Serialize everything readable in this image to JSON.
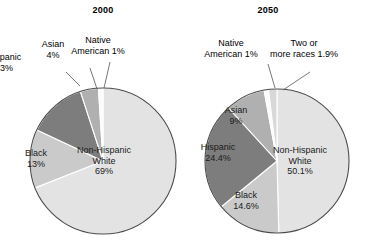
{
  "figure": {
    "background": "#ffffff",
    "charts": [
      {
        "id": "chart-2000",
        "title": "2000",
        "center": {
          "x": 103,
          "y": 161
        },
        "radius": 73
      },
      {
        "id": "chart-2050",
        "title": "2050",
        "center": {
          "x": 277,
          "y": 161
        },
        "radius": 72
      }
    ]
  },
  "labels": {
    "c2000": {
      "white": {
        "name": "Non-Hispanic",
        "name2": "White",
        "value": "69%"
      },
      "black": {
        "name": "Black",
        "value": "13%"
      },
      "hispanic": {
        "name": "Hispanic",
        "value": "13%"
      },
      "asian": {
        "name": "Asian",
        "value": "4%"
      },
      "native": {
        "name": "Native",
        "name2": "American 1%"
      }
    },
    "c2050": {
      "white": {
        "name": "Non-Hispanic",
        "name2": "White",
        "value": "50.1%"
      },
      "black": {
        "name": "Black",
        "value": "14.6%"
      },
      "hispanic": {
        "name": "Hispanic",
        "value": "24.4%"
      },
      "asian": {
        "name": "Asian",
        "value": "9%"
      },
      "native": {
        "name": "Native",
        "name2": "American 1%"
      },
      "tworaces": {
        "name": "Two or",
        "name2": "more races 1.9%"
      }
    }
  },
  "colors": {
    "non_hispanic_white": "#e3e3e3",
    "black": "#cacaca",
    "hispanic": "#7d7d7d",
    "asian": "#b0b0b0",
    "native_american": "#fbfbfb",
    "two_or_more_races": "#d8d8d8",
    "outline": "#4a4a4a",
    "separator": "#ffffff",
    "leader_line": "#555555",
    "text": "#000000"
  },
  "chart_data": [
    {
      "type": "pie",
      "title": "2000",
      "categories": [
        "Non-Hispanic White",
        "Black",
        "Hispanic",
        "Asian",
        "Native American"
      ],
      "values": [
        69,
        13,
        13,
        4,
        1
      ],
      "value_labels": [
        "69%",
        "13%",
        "13%",
        "4%",
        "1%"
      ],
      "units": "percent",
      "start_angle_deg": 0,
      "direction": "clockwise",
      "legend": "none (direct labels)",
      "slice_colors": [
        "#e3e3e3",
        "#cacaca",
        "#7d7d7d",
        "#b0b0b0",
        "#fbfbfb"
      ]
    },
    {
      "type": "pie",
      "title": "2050",
      "categories": [
        "Non-Hispanic White",
        "Black",
        "Hispanic",
        "Asian",
        "Native American",
        "Two or more races"
      ],
      "values": [
        50.1,
        14.6,
        24.4,
        9,
        1,
        1.9
      ],
      "value_labels": [
        "50.1%",
        "14.6%",
        "24.4%",
        "9%",
        "1%",
        "1.9%"
      ],
      "units": "percent",
      "start_angle_deg": 0,
      "direction": "clockwise",
      "legend": "none (direct labels)",
      "slice_colors": [
        "#e3e3e3",
        "#cacaca",
        "#7d7d7d",
        "#b0b0b0",
        "#fbfbfb",
        "#d8d8d8"
      ]
    }
  ]
}
